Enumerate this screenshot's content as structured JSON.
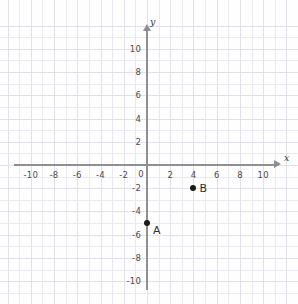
{
  "chart_data": {
    "type": "scatter",
    "title": "",
    "xlabel": "x",
    "ylabel": "y",
    "xlim": [
      -11.5,
      11.5
    ],
    "ylim": [
      -11.5,
      12
    ],
    "grid": true,
    "legend": "none",
    "x_ticks": [
      "-10",
      "-8",
      "-6",
      "-4",
      "-2",
      "0",
      "2",
      "4",
      "6",
      "8",
      "10"
    ],
    "x_tick_values": [
      -10,
      -8,
      -6,
      -4,
      -2,
      0,
      2,
      4,
      6,
      8,
      10
    ],
    "y_ticks": [
      "10",
      "8",
      "6",
      "4",
      "2",
      "-2",
      "-4",
      "-6",
      "-8",
      "-10"
    ],
    "y_tick_values": [
      10,
      8,
      6,
      4,
      2,
      -2,
      -4,
      -6,
      -8,
      -10
    ],
    "origin_label": "0",
    "points": [
      {
        "label": "A",
        "x": 0,
        "y": -5
      },
      {
        "label": "B",
        "x": 4,
        "y": -2
      }
    ],
    "colors": {
      "point": "#1a1a1a",
      "axis": "#8e8e93",
      "grid": "#ebe9ef",
      "text": "#4a4a4f",
      "background": "#fefefe"
    }
  }
}
